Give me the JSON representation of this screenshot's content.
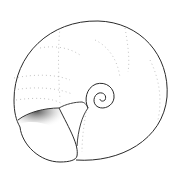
{
  "image": {
    "subject": "snail shell illustration",
    "style": "stippled pen-and-ink line drawing",
    "background_color": "#ffffff",
    "ink_color": "#2a2a2a"
  }
}
